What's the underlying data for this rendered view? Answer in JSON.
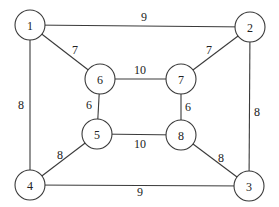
{
  "diagram": {
    "type": "weighted-undirected-graph",
    "nodes": [
      {
        "id": "1",
        "label": "1",
        "x": 30,
        "y": 25
      },
      {
        "id": "2",
        "label": "2",
        "x": 250,
        "y": 27
      },
      {
        "id": "3",
        "label": "3",
        "x": 249,
        "y": 186
      },
      {
        "id": "4",
        "label": "4",
        "x": 30,
        "y": 185
      },
      {
        "id": "5",
        "label": "5",
        "x": 97,
        "y": 134
      },
      {
        "id": "6",
        "label": "6",
        "x": 100,
        "y": 79
      },
      {
        "id": "7",
        "label": "7",
        "x": 181,
        "y": 79
      },
      {
        "id": "8",
        "label": "8",
        "x": 181,
        "y": 135
      }
    ],
    "edges": [
      {
        "from": "1",
        "to": "2",
        "weight": "9",
        "lx": 144,
        "ly": 17
      },
      {
        "from": "1",
        "to": "6",
        "weight": "7",
        "lx": 75,
        "ly": 50
      },
      {
        "from": "1",
        "to": "4",
        "weight": "8",
        "lx": 21,
        "ly": 105
      },
      {
        "from": "2",
        "to": "7",
        "weight": "7",
        "lx": 209,
        "ly": 50
      },
      {
        "from": "2",
        "to": "3",
        "weight": "8",
        "lx": 257,
        "ly": 112
      },
      {
        "from": "6",
        "to": "7",
        "weight": "10",
        "lx": 140,
        "ly": 70
      },
      {
        "from": "6",
        "to": "5",
        "weight": "6",
        "lx": 89,
        "ly": 105
      },
      {
        "from": "7",
        "to": "8",
        "weight": "6",
        "lx": 188,
        "ly": 107
      },
      {
        "from": "5",
        "to": "8",
        "weight": "10",
        "lx": 140,
        "ly": 144
      },
      {
        "from": "5",
        "to": "4",
        "weight": "8",
        "lx": 60,
        "ly": 155
      },
      {
        "from": "8",
        "to": "3",
        "weight": "8",
        "lx": 221,
        "ly": 158
      },
      {
        "from": "4",
        "to": "3",
        "weight": "9",
        "lx": 140,
        "ly": 192
      }
    ]
  }
}
